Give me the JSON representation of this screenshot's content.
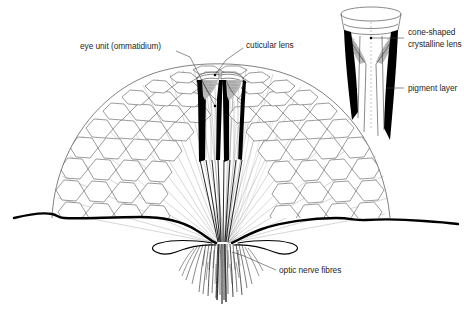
{
  "figure": {
    "background_color": "#ffffff",
    "ink_color": "#000000"
  },
  "labels": {
    "eye_unit": "eye unit (ommatidium)",
    "cuticular_lens": "cuticular lens",
    "cone_shaped_line1": "cone-shaped",
    "cone_shaped_line2": "crystalline lens",
    "pigment_layer": "pigment layer",
    "optic_nerve_fibres": "optic nerve fibres"
  },
  "caption": {
    "text": ""
  },
  "diagram_parts": {
    "main_view": "sectioned compound eye dome with hexagonal facets",
    "inset_view": "single ommatidium detail",
    "nerve_bundle": "converging optic nerve fibre sheaf",
    "head_outline": "body surface contour line"
  }
}
